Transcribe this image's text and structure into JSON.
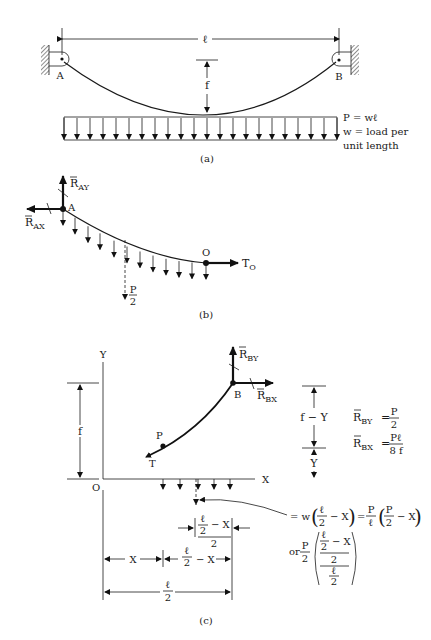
{
  "figure_a": {
    "caption": "(a)",
    "span_label": "ℓ",
    "sag_label": "f",
    "support_left": "A",
    "support_right": "B",
    "load_note": [
      "P = wℓ",
      "w = load per",
      "unit length"
    ]
  },
  "figure_b": {
    "caption": "(b)",
    "reaction_ay": "R",
    "reaction_ay_sub": "AY",
    "reaction_ax": "R",
    "reaction_ax_sub": "AX",
    "point_a": "A",
    "point_o": "O",
    "tension": "T",
    "tension_sub": "O",
    "resultant_num": "P",
    "resultant_den": "2"
  },
  "figure_c": {
    "caption": "(c)",
    "axis_y": "Y",
    "axis_x": "X",
    "origin": "O",
    "point_b": "B",
    "point_p": "P",
    "tension": "T",
    "reaction_by": "R",
    "reaction_by_sub": "BY",
    "reaction_bx": "R",
    "reaction_bx_sub": "BX",
    "dim_f": "f",
    "dim_f_minus_y": "f − Y",
    "dim_y": "Y",
    "eq_rby_lhs": "R",
    "eq_rby_sub": "BY",
    "eq_rby_num": "P",
    "eq_rby_den": "2",
    "eq_rbx_lhs": "R",
    "eq_rbx_sub": "BX",
    "eq_rbx_num": "Pℓ",
    "eq_rbx_den": "8 f",
    "load_eq_line1": [
      "= w",
      "ℓ",
      "2",
      "− X",
      "=",
      "P",
      "ℓ",
      "P",
      "2",
      "− X"
    ],
    "load_eq_line2": [
      "or",
      "P",
      "2",
      "ℓ",
      "2",
      "− X",
      "2",
      "ℓ",
      "2"
    ],
    "dim_half_label": [
      "ℓ",
      "2",
      "− X",
      "2"
    ],
    "dim_x": "X",
    "dim_l2_minus_x": [
      "ℓ",
      "2",
      "− X"
    ],
    "dim_l2": [
      "ℓ",
      "2"
    ],
    "equal": "="
  }
}
